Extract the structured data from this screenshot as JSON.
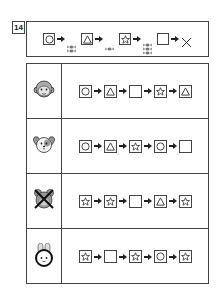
{
  "question": {
    "number": "14"
  },
  "legend": {
    "items": [
      {
        "shape": "circle",
        "result": "candy",
        "candy_count": 2
      },
      {
        "shape": "triangle",
        "result": "candy",
        "candy_count": 1
      },
      {
        "shape": "star",
        "result": "candy",
        "candy_count": 3
      },
      {
        "shape": "blank",
        "result": "none",
        "candy_count": 0
      }
    ],
    "none_symbol": "×"
  },
  "rows": [
    {
      "character": "monkey-icon",
      "sequence": [
        "circle",
        "triangle",
        "blank",
        "star",
        "triangle"
      ]
    },
    {
      "character": "dog-icon",
      "sequence": [
        "circle",
        "triangle",
        "star",
        "circle",
        "blank"
      ]
    },
    {
      "character": "mouse-crossed-icon",
      "sequence": [
        "star",
        "star",
        "blank",
        "triangle",
        "star"
      ]
    },
    {
      "character": "rabbit-icon",
      "sequence": [
        "star",
        "blank",
        "star",
        "circle",
        "star"
      ]
    }
  ],
  "colors": {
    "line": "#444444",
    "candy": "#777777",
    "face_fill": "#bdbdbd"
  }
}
